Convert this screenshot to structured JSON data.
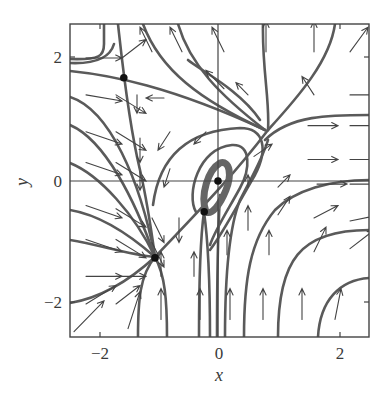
{
  "chart_data": {
    "type": "scatter",
    "subtype": "phase_portrait_vector_field",
    "title": "",
    "xlabel": "x",
    "ylabel": "y",
    "xlim": [
      -2.5,
      2.5
    ],
    "ylim": [
      -2.55,
      2.6
    ],
    "x_ticks": [
      {
        "value": -2,
        "label": "−2"
      },
      {
        "value": 0,
        "label": "0"
      },
      {
        "value": 2,
        "label": "2"
      }
    ],
    "y_ticks": [
      {
        "value": -2,
        "label": "−2"
      },
      {
        "value": 0,
        "label": "0"
      },
      {
        "value": 2,
        "label": "2"
      }
    ],
    "grid": false,
    "axes_lines_through_origin": true,
    "legend": null,
    "equilibria": [
      {
        "x": -1.57,
        "y": 1.68,
        "kind": "saddle"
      },
      {
        "x": 0.8,
        "y": 1.0,
        "kind": "saddle-like junction"
      },
      {
        "x": -1.05,
        "y": -1.25,
        "kind": "node"
      },
      {
        "x": -0.23,
        "y": -0.5,
        "kind": "saddle"
      },
      {
        "x": 0.0,
        "y": 0.0,
        "kind": "spiral/center"
      }
    ],
    "vector_field_arrows": [
      {
        "x": -2.2,
        "y": 2.0,
        "dx": 0.6,
        "dy": 0.0
      },
      {
        "x": -1.6,
        "y": 2.0,
        "dx": 0.4,
        "dy": 0.3
      },
      {
        "x": -1.1,
        "y": 2.1,
        "dx": -0.2,
        "dy": 0.4
      },
      {
        "x": -0.6,
        "y": 2.1,
        "dx": -0.2,
        "dy": 0.4
      },
      {
        "x": 0.1,
        "y": 2.1,
        "dx": -0.2,
        "dy": 0.4
      },
      {
        "x": 0.8,
        "y": 2.1,
        "dx": 0.0,
        "dy": 0.5
      },
      {
        "x": 1.6,
        "y": 2.1,
        "dx": 0.0,
        "dy": 0.5
      },
      {
        "x": 2.2,
        "y": 2.1,
        "dx": 0.3,
        "dy": 0.4
      },
      {
        "x": -2.2,
        "y": 1.4,
        "dx": 0.6,
        "dy": -0.1
      },
      {
        "x": -1.7,
        "y": 1.4,
        "dx": 0.5,
        "dy": -0.3
      },
      {
        "x": -1.35,
        "y": 1.4,
        "dx": 0.0,
        "dy": -0.3
      },
      {
        "x": -0.9,
        "y": 1.35,
        "dx": -0.3,
        "dy": 0.0
      },
      {
        "x": 0.1,
        "y": 1.5,
        "dx": -0.3,
        "dy": 0.3
      },
      {
        "x": 0.5,
        "y": 1.4,
        "dx": -0.2,
        "dy": 0.2
      },
      {
        "x": 1.6,
        "y": 1.4,
        "dx": -0.2,
        "dy": 0.3
      },
      {
        "x": 2.2,
        "y": 1.4,
        "dx": 0.5,
        "dy": 0.0
      },
      {
        "x": -2.2,
        "y": 0.8,
        "dx": 0.6,
        "dy": -0.2
      },
      {
        "x": -1.7,
        "y": 0.8,
        "dx": 0.5,
        "dy": -0.3
      },
      {
        "x": -1.3,
        "y": 0.7,
        "dx": 0.0,
        "dy": -0.4
      },
      {
        "x": -0.8,
        "y": 0.8,
        "dx": -0.2,
        "dy": -0.3
      },
      {
        "x": -0.2,
        "y": 0.8,
        "dx": -0.2,
        "dy": -0.2
      },
      {
        "x": 1.5,
        "y": 0.9,
        "dx": 0.5,
        "dy": 0.0
      },
      {
        "x": 2.2,
        "y": 0.9,
        "dx": 0.5,
        "dy": 0.0
      },
      {
        "x": -2.2,
        "y": 0.3,
        "dx": 0.6,
        "dy": -0.2
      },
      {
        "x": -1.7,
        "y": 0.3,
        "dx": 0.5,
        "dy": -0.3
      },
      {
        "x": -1.3,
        "y": 0.15,
        "dx": 0.0,
        "dy": -0.3
      },
      {
        "x": -0.8,
        "y": 0.2,
        "dx": -0.1,
        "dy": -0.3
      },
      {
        "x": 0.6,
        "y": 0.4,
        "dx": 0.3,
        "dy": 0.2
      },
      {
        "x": 1.5,
        "y": 0.35,
        "dx": 0.5,
        "dy": 0.0
      },
      {
        "x": 2.2,
        "y": 0.35,
        "dx": 0.5,
        "dy": 0.0
      },
      {
        "x": -2.2,
        "y": -0.4,
        "dx": 0.6,
        "dy": -0.2
      },
      {
        "x": -1.7,
        "y": -0.45,
        "dx": 0.5,
        "dy": -0.3
      },
      {
        "x": -1.1,
        "y": -0.6,
        "dx": 0.2,
        "dy": -0.4
      },
      {
        "x": -0.65,
        "y": -0.6,
        "dx": 0.0,
        "dy": -0.4
      },
      {
        "x": 0.5,
        "y": -0.1,
        "dx": 0.0,
        "dy": 0.2
      },
      {
        "x": 1.0,
        "y": -0.1,
        "dx": 0.2,
        "dy": 0.2
      },
      {
        "x": 1.65,
        "y": -0.05,
        "dx": 0.5,
        "dy": 0.0
      },
      {
        "x": 2.2,
        "y": -0.05,
        "dx": 0.5,
        "dy": 0.0
      },
      {
        "x": -2.2,
        "y": -0.95,
        "dx": 0.6,
        "dy": -0.2
      },
      {
        "x": -1.7,
        "y": -0.95,
        "dx": 0.5,
        "dy": -0.3
      },
      {
        "x": -1.1,
        "y": -1.0,
        "dx": 0.2,
        "dy": -0.4
      },
      {
        "x": 0.5,
        "y": -0.8,
        "dx": 0.0,
        "dy": 0.4
      },
      {
        "x": 1.0,
        "y": -0.55,
        "dx": 0.2,
        "dy": 0.3
      },
      {
        "x": 1.6,
        "y": -0.6,
        "dx": 0.4,
        "dy": 0.2
      },
      {
        "x": 2.2,
        "y": -0.65,
        "dx": 0.5,
        "dy": 0.1
      },
      {
        "x": -2.2,
        "y": -1.55,
        "dx": 0.6,
        "dy": 0.0
      },
      {
        "x": -1.7,
        "y": -1.55,
        "dx": 0.5,
        "dy": 0.0
      },
      {
        "x": -0.95,
        "y": -1.55,
        "dx": 0.0,
        "dy": 0.4
      },
      {
        "x": -0.4,
        "y": -1.55,
        "dx": 0.0,
        "dy": 0.4
      },
      {
        "x": 0.15,
        "y": -1.2,
        "dx": 0.0,
        "dy": 0.4
      },
      {
        "x": 0.85,
        "y": -1.2,
        "dx": 0.0,
        "dy": 0.4
      },
      {
        "x": 1.6,
        "y": -1.15,
        "dx": 0.2,
        "dy": 0.4
      },
      {
        "x": 2.2,
        "y": -1.1,
        "dx": 0.4,
        "dy": 0.3
      },
      {
        "x": -2.2,
        "y": -2.0,
        "dx": 0.5,
        "dy": 0.3
      },
      {
        "x": -1.7,
        "y": -2.0,
        "dx": 0.4,
        "dy": 0.3
      },
      {
        "x": -1.5,
        "y": -2.4,
        "dx": 0.2,
        "dy": 0.6
      },
      {
        "x": -0.95,
        "y": -2.25,
        "dx": 0.0,
        "dy": 0.5
      },
      {
        "x": -0.3,
        "y": -2.25,
        "dx": 0.0,
        "dy": 0.5
      },
      {
        "x": 0.2,
        "y": -2.25,
        "dx": 0.0,
        "dy": 0.5
      },
      {
        "x": 0.75,
        "y": -2.25,
        "dx": 0.0,
        "dy": 0.5
      },
      {
        "x": 1.4,
        "y": -2.25,
        "dx": 0.0,
        "dy": 0.5
      },
      {
        "x": 1.95,
        "y": -2.25,
        "dx": 0.1,
        "dy": 0.5
      },
      {
        "x": -2.4,
        "y": -2.45,
        "dx": 0.5,
        "dy": 0.5
      }
    ]
  },
  "labels": {
    "xlabel": "x",
    "ylabel": "y",
    "xtick_neg2": "−2",
    "xtick_0": "0",
    "xtick_2": "2",
    "ytick_neg2": "−2",
    "ytick_0": "0",
    "ytick_2": "2"
  }
}
